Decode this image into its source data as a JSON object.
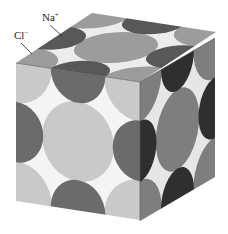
{
  "diagram": {
    "labels": {
      "na": "Na",
      "na_charge": "+",
      "cl": "Cl",
      "cl_charge": "−"
    },
    "colors": {
      "background": "#ffffff",
      "front_face_bg": "#f4f4f4",
      "front_cl": "#c9c9c9",
      "front_na": "#6b6b6b",
      "top_face_bg": "#ececec",
      "top_cl": "#9c9c9c",
      "top_na": "#585858",
      "right_face_bg": "#e6e6e6",
      "right_cl": "#7e7e7e",
      "right_na": "#2f2f2f"
    }
  }
}
